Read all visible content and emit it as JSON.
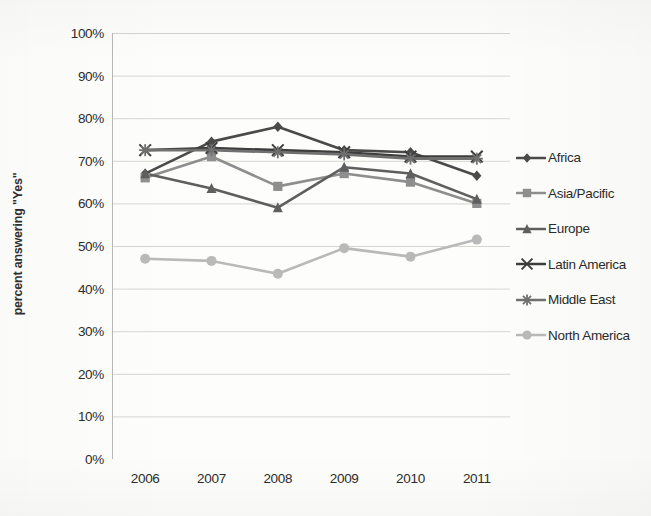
{
  "chart_data": {
    "type": "line",
    "title": "",
    "xlabel": "",
    "ylabel": "percent answering \"Yes\"",
    "x": [
      "2006",
      "2007",
      "2008",
      "2009",
      "2010",
      "2011"
    ],
    "categories": [
      "2006",
      "2007",
      "2008",
      "2009",
      "2010",
      "2011"
    ],
    "ylim": [
      0,
      100
    ],
    "yticks": [
      "0%",
      "10%",
      "20%",
      "30%",
      "40%",
      "50%",
      "60%",
      "70%",
      "80%",
      "90%",
      "100%"
    ],
    "ytick_values": [
      0,
      10,
      20,
      30,
      40,
      50,
      60,
      70,
      80,
      90,
      100
    ],
    "grid": "horizontal",
    "legend_position": "right",
    "series": [
      {
        "name": "Africa",
        "marker": "diamond",
        "color": "#4a4a4a",
        "values": [
          67,
          74.5,
          78,
          72.5,
          72,
          66.5
        ]
      },
      {
        "name": "Asia/Pacific",
        "marker": "square",
        "color": "#8e8e8e",
        "values": [
          66,
          71,
          64,
          67,
          65,
          60
        ]
      },
      {
        "name": "Europe",
        "marker": "triangle",
        "color": "#5f5f5f",
        "values": [
          67,
          63.5,
          59,
          68.5,
          67,
          61
        ]
      },
      {
        "name": "Latin America",
        "marker": "cross",
        "color": "#3d3d3d",
        "values": [
          72.5,
          73,
          72.5,
          72,
          71,
          71
        ]
      },
      {
        "name": "Middle East",
        "marker": "asterisk",
        "color": "#707070",
        "values": [
          72.5,
          72.5,
          72,
          71.5,
          70.5,
          70.5
        ]
      },
      {
        "name": "North America",
        "marker": "circle",
        "color": "#b9b9b9",
        "values": [
          47,
          46.5,
          43.5,
          49.5,
          47.5,
          51.5
        ]
      }
    ]
  },
  "legend": {
    "items": [
      {
        "label": "Africa"
      },
      {
        "label": "Asia/Pacific"
      },
      {
        "label": "Europe"
      },
      {
        "label": "Latin America"
      },
      {
        "label": "Middle East"
      },
      {
        "label": "North America"
      }
    ]
  }
}
